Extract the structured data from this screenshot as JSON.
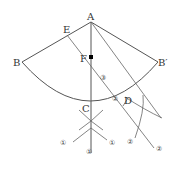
{
  "diagram": {
    "points": {
      "A": "A",
      "B": "B",
      "B_prime": "B′",
      "C": "C",
      "D": "D",
      "E": "E",
      "F": "F"
    },
    "marks": {
      "step1": "①",
      "step2": "②",
      "step3": "③"
    },
    "colors": {
      "line": "#555555",
      "point": "#000000"
    }
  }
}
